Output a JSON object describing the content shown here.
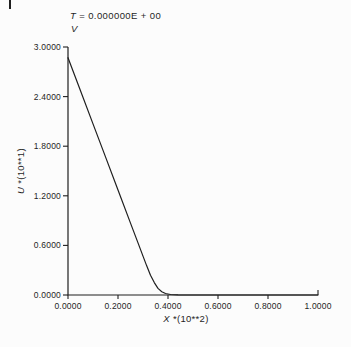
{
  "colors": {
    "ink": "#1f1f1f",
    "paper": "#fcfcfc"
  },
  "header": {
    "time_var": "T",
    "time_value": "= 0.000000E + 00",
    "series_label": "V"
  },
  "axes": {
    "y_var": "U",
    "y_scale": "*(10**1)",
    "x_var": "X",
    "x_scale": "*(10**2)"
  },
  "chart_data": {
    "type": "line",
    "subtitle": "V",
    "xlabel": "X *(10**2)",
    "ylabel": "U *(10**1)",
    "xlim": [
      0.0,
      1.0
    ],
    "ylim": [
      0.0,
      3.0
    ],
    "grid": false,
    "legend": "none",
    "x_ticks": {
      "values": [
        0.0,
        0.2,
        0.4,
        0.6,
        0.8,
        1.0
      ],
      "labels": [
        "0.0000",
        "0.2000",
        "0.4000",
        "0.6000",
        "0.8000",
        "1.0000"
      ]
    },
    "y_ticks": {
      "values": [
        0.0,
        0.6,
        1.2,
        1.8,
        2.4,
        3.0
      ],
      "labels": [
        "0.0000",
        "0.6000",
        "1.2000",
        "1.8000",
        "2.4000",
        "3.0000"
      ]
    },
    "series": [
      {
        "name": "V",
        "color": "#1f1f1f",
        "points": [
          [
            0.0,
            2.87
          ],
          [
            0.05,
            2.47
          ],
          [
            0.1,
            2.07
          ],
          [
            0.15,
            1.67
          ],
          [
            0.2,
            1.27
          ],
          [
            0.25,
            0.87
          ],
          [
            0.28,
            0.63
          ],
          [
            0.3,
            0.47
          ],
          [
            0.315,
            0.35
          ],
          [
            0.33,
            0.24
          ],
          [
            0.345,
            0.15
          ],
          [
            0.36,
            0.08
          ],
          [
            0.375,
            0.04
          ],
          [
            0.39,
            0.018
          ],
          [
            0.41,
            0.006
          ],
          [
            0.44,
            0.001
          ],
          [
            0.48,
            0.0
          ],
          [
            0.6,
            0.0
          ],
          [
            0.8,
            0.0
          ],
          [
            1.0,
            0.0
          ]
        ]
      }
    ]
  }
}
